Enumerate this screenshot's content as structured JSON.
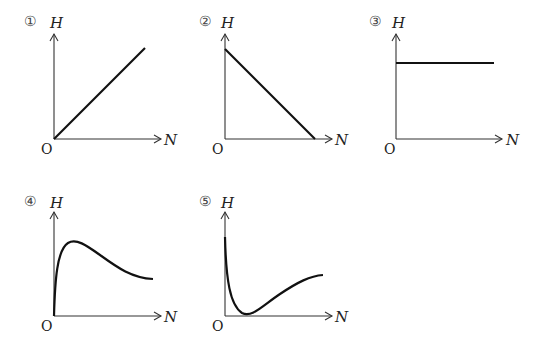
{
  "graphs": [
    {
      "number": "①",
      "y_label": "H",
      "x_label": "N",
      "origin": "O",
      "shape": "linear increasing from origin"
    },
    {
      "number": "②",
      "y_label": "H",
      "x_label": "N",
      "origin": "O",
      "shape": "linear decreasing to x-axis"
    },
    {
      "number": "③",
      "y_label": "H",
      "x_label": "N",
      "origin": "O",
      "shape": "constant horizontal"
    },
    {
      "number": "④",
      "y_label": "H",
      "x_label": "N",
      "origin": "O",
      "shape": "rises sharply to peak then decays"
    },
    {
      "number": "⑤",
      "y_label": "H",
      "x_label": "N",
      "origin": "O",
      "shape": "drops sharply to minimum then rises"
    }
  ]
}
